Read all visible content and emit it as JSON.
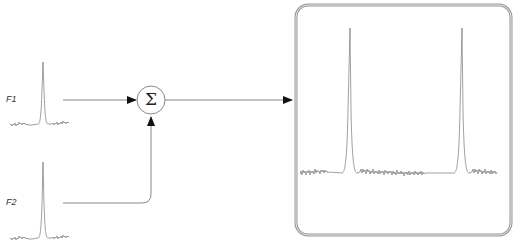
{
  "diagram": {
    "inputs": [
      {
        "id": "F1",
        "label": "F1"
      },
      {
        "id": "F2",
        "label": "F2"
      }
    ],
    "operator": {
      "name": "summation",
      "symbol": "Σ"
    },
    "output": {
      "description": "Combined spectrum with two peaks",
      "peak_count": 2
    },
    "colors": {
      "line": "#888888",
      "arrow": "#111111",
      "box_border": "#9a9a9a",
      "trace": "#777777",
      "text": "#333333"
    }
  }
}
